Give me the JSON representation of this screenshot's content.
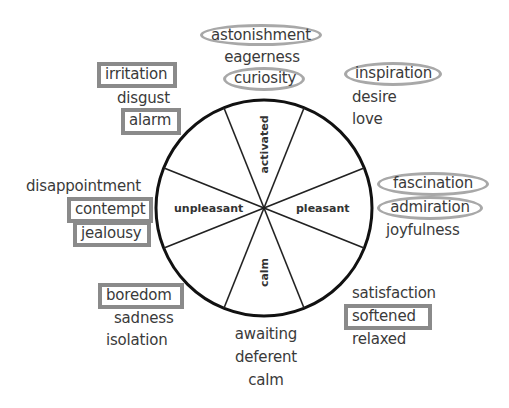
{
  "diagram": {
    "type": "circumplex emotion wheel",
    "axes": {
      "top": "activated",
      "bottom": "calm",
      "left": "unpleasant",
      "right": "pleasant"
    },
    "colors": {
      "wheel_stroke": "#111111",
      "box_border": "#8a8a8a",
      "oval_border": "#a8a8a8",
      "text": "#3a3a3a"
    },
    "clusters": {
      "top": [
        {
          "word": "astonishment",
          "mark": "oval"
        },
        {
          "word": "eagerness",
          "mark": "none"
        },
        {
          "word": "curiosity",
          "mark": "oval"
        }
      ],
      "top_right": [
        {
          "word": "inspiration",
          "mark": "oval"
        },
        {
          "word": "desire",
          "mark": "none"
        },
        {
          "word": "love",
          "mark": "none"
        }
      ],
      "right": [
        {
          "word": "fascination",
          "mark": "oval"
        },
        {
          "word": "admiration",
          "mark": "oval"
        },
        {
          "word": "joyfulness",
          "mark": "none"
        }
      ],
      "bottom_right": [
        {
          "word": "satisfaction",
          "mark": "none"
        },
        {
          "word": "softened",
          "mark": "box"
        },
        {
          "word": "relaxed",
          "mark": "none"
        }
      ],
      "bottom": [
        {
          "word": "awaiting",
          "mark": "none"
        },
        {
          "word": "deferent",
          "mark": "none"
        },
        {
          "word": "calm",
          "mark": "none"
        }
      ],
      "bottom_left": [
        {
          "word": "boredom",
          "mark": "box"
        },
        {
          "word": "sadness",
          "mark": "none"
        },
        {
          "word": "isolation",
          "mark": "none"
        }
      ],
      "left": [
        {
          "word": "disappointment",
          "mark": "none"
        },
        {
          "word": "contempt",
          "mark": "box"
        },
        {
          "word": "jealousy",
          "mark": "box"
        }
      ],
      "top_left": [
        {
          "word": "irritation",
          "mark": "box"
        },
        {
          "word": "disgust",
          "mark": "none"
        },
        {
          "word": "alarm",
          "mark": "box"
        }
      ]
    }
  }
}
